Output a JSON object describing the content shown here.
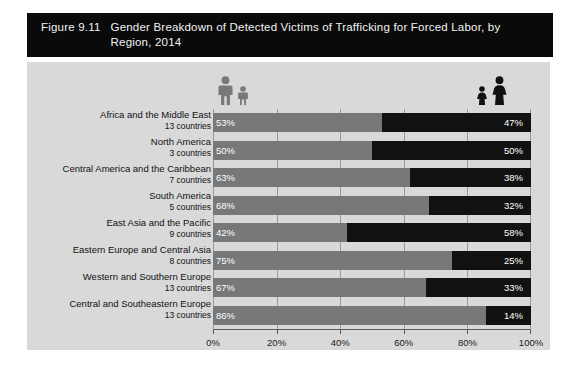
{
  "figure": {
    "number": "Figure 9.11",
    "title": "Gender Breakdown of Detected Victims of Trafficking for Forced Labor, by Region, 2014"
  },
  "legend": {
    "left_icon_adult": "man-icon",
    "left_icon_child": "boy-icon",
    "right_icon_child": "girl-icon",
    "right_icon_adult": "woman-icon",
    "male_color": "#787878",
    "female_color": "#111111"
  },
  "chart_data": {
    "type": "bar",
    "orientation": "horizontal",
    "stacked": true,
    "title": "Gender Breakdown of Detected Victims of Trafficking for Forced Labor, by Region, 2014",
    "xlabel": "",
    "ylabel": "",
    "xlim": [
      0,
      100
    ],
    "xticks": [
      0,
      20,
      40,
      60,
      80,
      100
    ],
    "xtick_labels": [
      "0%",
      "20%",
      "40%",
      "60%",
      "80%",
      "100%"
    ],
    "grid": true,
    "legend_position": "top",
    "categories": [
      "Africa and the Middle East",
      "North America",
      "Central America and the Caribbean",
      "South America",
      "East Asia and the Pacific",
      "Eastern Europe and Central Asia",
      "Western and Southern Europe",
      "Central and Southeastern Europe"
    ],
    "category_subtitles": [
      "13 countries",
      "3 countries",
      "7 countries",
      "5 countries",
      "9 countries",
      "8 countries",
      "13 countries",
      "13 countries"
    ],
    "series": [
      {
        "name": "Males and boys",
        "color": "#787878",
        "values": [
          53,
          50,
          63,
          68,
          42,
          75,
          67,
          86
        ],
        "labels": [
          "53%",
          "50%",
          "63%",
          "68%",
          "42%",
          "75%",
          "67%",
          "86%"
        ]
      },
      {
        "name": "Females and girls",
        "color": "#111111",
        "values": [
          47,
          50,
          38,
          32,
          58,
          25,
          33,
          14
        ],
        "labels": [
          "47%",
          "50%",
          "38%",
          "32%",
          "58%",
          "25%",
          "33%",
          "14%"
        ]
      }
    ]
  }
}
